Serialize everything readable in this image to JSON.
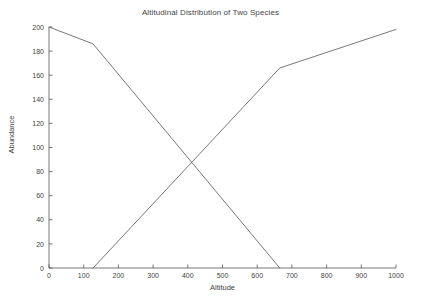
{
  "chart_data": {
    "type": "line",
    "title": "Altitudinal Distribution of Two Species",
    "xlabel": "Altitude",
    "ylabel": "Abundance",
    "xlim": [
      0,
      1000
    ],
    "ylim": [
      0,
      200
    ],
    "grid": false,
    "legend": "none",
    "xticks": [
      0,
      100,
      200,
      300,
      400,
      500,
      600,
      700,
      800,
      900,
      1000
    ],
    "xticklabels": [
      "0",
      "100",
      "200",
      "300",
      "400",
      "500",
      "600",
      "700",
      "800",
      "900",
      "1000"
    ],
    "yticks": [
      0,
      20,
      40,
      60,
      80,
      100,
      120,
      140,
      160,
      180,
      200
    ],
    "yticklabels": [
      "0",
      "20",
      "40",
      "60",
      "80",
      "100",
      "120",
      "140",
      "160",
      "180",
      "200"
    ],
    "line_color": "#555555",
    "axis_color": "#555555",
    "series": [
      {
        "name": "declining-species",
        "x": [
          0,
          127,
          665
        ],
        "values": [
          200,
          186,
          0
        ]
      },
      {
        "name": "rising-species",
        "x": [
          127,
          665,
          1000
        ],
        "values": [
          0,
          166,
          198
        ]
      }
    ],
    "annotations": {
      "crossing_point": {
        "x": 410,
        "y": 88
      }
    }
  }
}
